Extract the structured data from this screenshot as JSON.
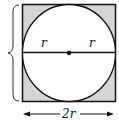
{
  "diagram": {
    "labels": {
      "radius_left": "r",
      "radius_right": "r",
      "side_width": "2r",
      "side_height": "2r"
    },
    "colors": {
      "square_fill": "#d4d4d4",
      "circle_fill": "#ffffff",
      "stroke": "#111111"
    }
  }
}
